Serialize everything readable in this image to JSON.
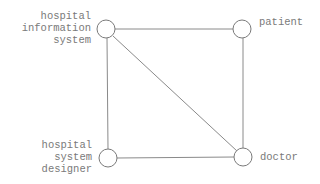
{
  "diagram": {
    "type": "graph",
    "nodes": [
      {
        "id": "his",
        "label": "hospital\ninformation\nsystem",
        "cx": 106,
        "cy": 29
      },
      {
        "id": "patient",
        "label": "patient",
        "cx": 242,
        "cy": 29
      },
      {
        "id": "hsd",
        "label": "hospital\nsystem\ndesigner",
        "cx": 108,
        "cy": 158
      },
      {
        "id": "doctor",
        "label": "doctor",
        "cx": 243,
        "cy": 157
      }
    ],
    "edges": [
      {
        "from": "his",
        "to": "patient"
      },
      {
        "from": "his",
        "to": "hsd"
      },
      {
        "from": "his",
        "to": "doctor"
      },
      {
        "from": "patient",
        "to": "doctor"
      },
      {
        "from": "hsd",
        "to": "doctor"
      }
    ],
    "colors": {
      "stroke": "#8a8a8a",
      "text": "#7a7a7a",
      "background": "#ffffff"
    }
  }
}
